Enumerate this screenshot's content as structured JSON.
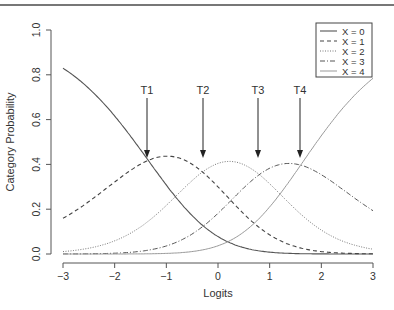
{
  "chart_data": {
    "type": "line",
    "title": "",
    "xlabel": "Logits",
    "ylabel": "Category Probability",
    "xlim": [
      -3,
      3
    ],
    "ylim": [
      0,
      1.0
    ],
    "x_ticks": [
      "-3",
      "-2",
      "-1",
      "0",
      "1",
      "2",
      "3"
    ],
    "y_ticks": [
      "0.0",
      "0.2",
      "0.4",
      "0.6",
      "0.8",
      "1.0"
    ],
    "grid": false,
    "legend_position": "top-right",
    "model": "partial credit",
    "thresholds": [
      {
        "label": "T1",
        "value": -1.35
      },
      {
        "label": "T2",
        "value": -0.3
      },
      {
        "label": "T3",
        "value": 0.8
      },
      {
        "label": "T4",
        "value": 1.6
      }
    ],
    "series": [
      {
        "name": "X = 0",
        "style": "solid",
        "color": "#555555"
      },
      {
        "name": "X = 1",
        "style": "dashed",
        "color": "#444444"
      },
      {
        "name": "X = 2",
        "style": "dotted",
        "color": "#777777"
      },
      {
        "name": "X = 3",
        "style": "dashdot",
        "color": "#555555"
      },
      {
        "name": "X = 4",
        "style": "solid-light",
        "color": "#999999"
      }
    ],
    "approx_peaks": {
      "X = 1": {
        "x": -0.95,
        "y": 0.44
      },
      "X = 2": {
        "x": 0.2,
        "y": 0.41
      },
      "X = 3": {
        "x": 1.35,
        "y": 0.41
      }
    },
    "endpoints": {
      "X = 0": {
        "x_min": 0.82,
        "x_max": 0.0
      },
      "X = 1": {
        "x_min": 0.16,
        "x_max": 0.0
      },
      "X = 4": {
        "x_min": 0.0,
        "x_max": 0.79
      },
      "X = 3": {
        "x_max": 0.19
      }
    }
  }
}
